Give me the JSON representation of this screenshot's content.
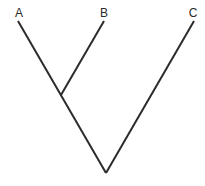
{
  "diagram": {
    "type": "cladogram",
    "taxa": [
      {
        "label": "A",
        "tip": [
          18,
          21
        ],
        "label_pos": [
          19,
          17
        ]
      },
      {
        "label": "B",
        "tip": [
          104,
          21
        ],
        "label_pos": [
          104,
          17
        ]
      },
      {
        "label": "C",
        "tip": [
          194,
          21
        ],
        "label_pos": [
          193,
          17
        ]
      }
    ],
    "nodes": {
      "ab_node": [
        61,
        95
      ],
      "root": [
        106,
        173
      ]
    },
    "branches": [
      {
        "from": "A",
        "to": "root"
      },
      {
        "from": "B",
        "to": "ab_node"
      },
      {
        "from": "C",
        "to": "root"
      }
    ],
    "line_color": "#2b2b2b",
    "background": "#ffffff"
  }
}
